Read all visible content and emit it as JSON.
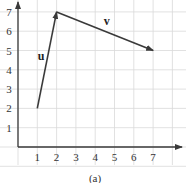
{
  "chart_data": {
    "type": "line",
    "title": "",
    "caption": "(a)",
    "xlabel": "",
    "ylabel": "",
    "xlim": [
      0,
      8.5
    ],
    "ylim": [
      0,
      7.5
    ],
    "x_ticks": [
      "1",
      "2",
      "3",
      "4",
      "5",
      "6",
      "7"
    ],
    "y_ticks": [
      "1",
      "2",
      "3",
      "4",
      "5",
      "6",
      "7"
    ],
    "grid": true,
    "series": [
      {
        "name": "u",
        "x": [
          1,
          2
        ],
        "y": [
          2,
          7
        ],
        "style": "arrow"
      },
      {
        "name": "v",
        "x": [
          2,
          7
        ],
        "y": [
          7,
          5
        ],
        "style": "arrow"
      }
    ],
    "annotations": [
      {
        "text": "u",
        "x": 1.2,
        "y": 4.5
      },
      {
        "text": "v",
        "x": 4.6,
        "y": 6.3
      }
    ]
  },
  "colors": {
    "vector": "#3a3a3a",
    "grid": "#d9d9d9",
    "axis": "#3a3a3a"
  }
}
